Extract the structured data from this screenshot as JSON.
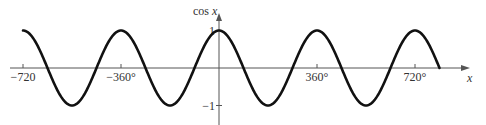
{
  "chart_data": {
    "type": "line",
    "title": "",
    "function": "cos x",
    "xlabel": "x",
    "ylabel": "cos x",
    "x_unit": "degrees",
    "xlim": [
      -720,
      810
    ],
    "ylim": [
      -1,
      1
    ],
    "x_ticks": [
      {
        "value": -720,
        "label": "−720"
      },
      {
        "value": -360,
        "label": "−360°"
      },
      {
        "value": 360,
        "label": "360°"
      },
      {
        "value": 720,
        "label": "720°"
      }
    ],
    "y_ticks": [
      {
        "value": 1,
        "label": "1"
      },
      {
        "value": -1,
        "label": "−1"
      }
    ],
    "series": [
      {
        "name": "cos x",
        "color": "#111111",
        "x": [
          -720,
          -630,
          -540,
          -450,
          -360,
          -270,
          -180,
          -90,
          0,
          90,
          180,
          270,
          360,
          450,
          540,
          630,
          720,
          810
        ],
        "values": [
          1,
          0,
          -1,
          0,
          1,
          0,
          -1,
          0,
          1,
          0,
          -1,
          0,
          1,
          0,
          -1,
          0,
          1,
          0
        ]
      }
    ],
    "grid": false,
    "legend": null,
    "axis_color": "#555555"
  }
}
